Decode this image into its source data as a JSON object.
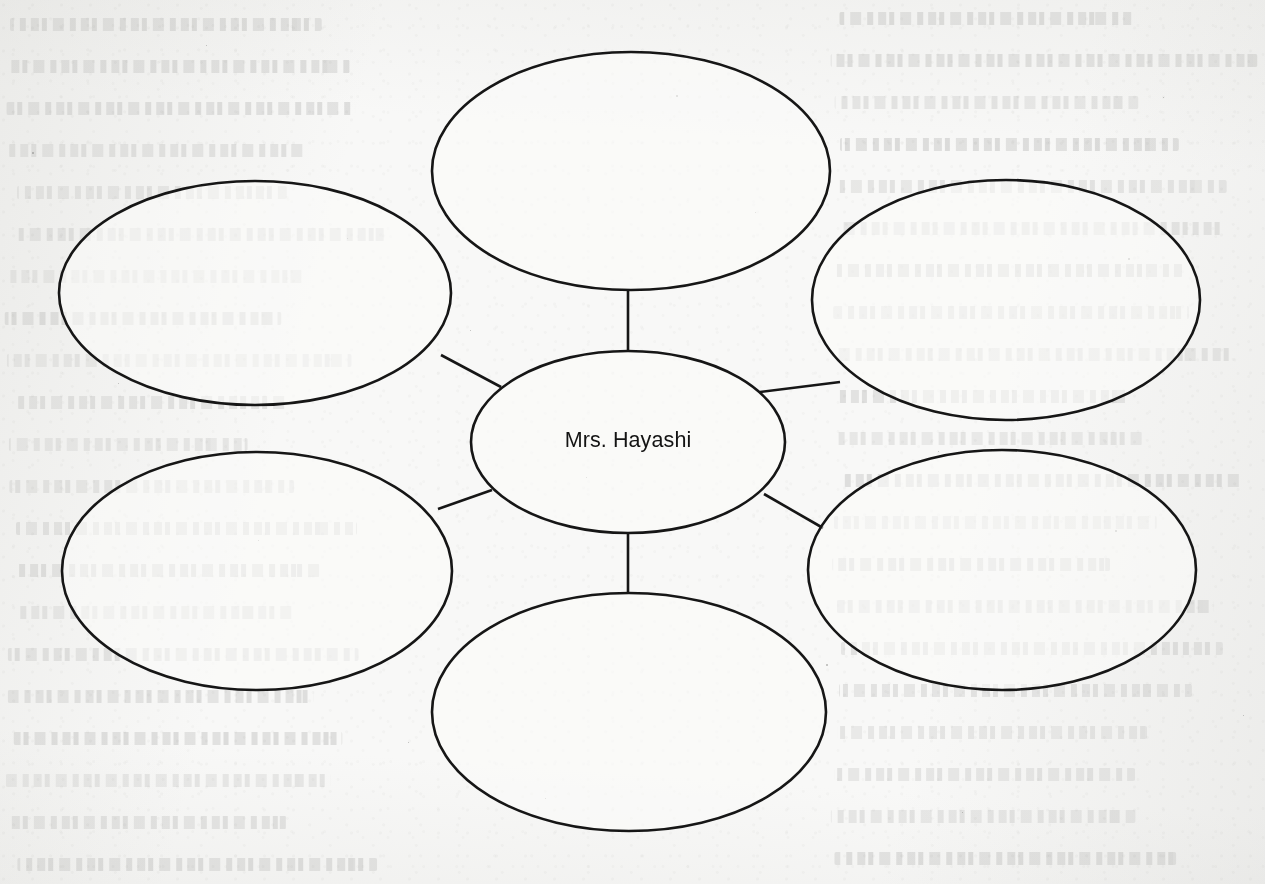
{
  "document": {
    "type": "graphic-organizer-worksheet",
    "description": "Blank character web / bubble map graphic organizer printed on a textured paper page with faint show-through text from the reverse side",
    "page_width": 1265,
    "page_height": 884,
    "paper_color": "#f8f8f7",
    "ink_color": "#161616"
  },
  "organizer": {
    "center": {
      "id": "center-bubble",
      "label": "Mrs. Hayashi",
      "cx": 628,
      "cy": 442,
      "rx": 157,
      "ry": 91,
      "text_x": 628,
      "text_y": 441
    },
    "outer_bubbles": [
      {
        "id": "bubble-top-left",
        "position": "top-left",
        "label": "",
        "cx": 255,
        "cy": 293,
        "rx": 196,
        "ry": 112
      },
      {
        "id": "bubble-top-center",
        "position": "top-center",
        "label": "",
        "cx": 631,
        "cy": 171,
        "rx": 199,
        "ry": 119
      },
      {
        "id": "bubble-top-right",
        "position": "top-right",
        "label": "",
        "cx": 1006,
        "cy": 300,
        "rx": 194,
        "ry": 120
      },
      {
        "id": "bubble-bottom-left",
        "position": "bottom-left",
        "label": "",
        "cx": 257,
        "cy": 571,
        "rx": 195,
        "ry": 119
      },
      {
        "id": "bubble-bottom-center",
        "position": "bottom-center",
        "label": "",
        "cx": 629,
        "cy": 712,
        "rx": 197,
        "ry": 119
      },
      {
        "id": "bubble-bottom-right",
        "position": "bottom-right",
        "label": "",
        "cx": 1002,
        "cy": 570,
        "rx": 194,
        "ry": 120
      }
    ],
    "connectors": [
      {
        "id": "connector-top-center",
        "from": "center-bubble",
        "to": "bubble-top-center",
        "x1": 628,
        "y1": 352,
        "x2": 628,
        "y2": 289
      },
      {
        "id": "connector-bottom-center",
        "from": "center-bubble",
        "to": "bubble-bottom-center",
        "x1": 628,
        "y1": 533,
        "x2": 628,
        "y2": 594
      },
      {
        "id": "connector-top-left",
        "from": "center-bubble",
        "to": "bubble-top-left",
        "x1": 501,
        "y1": 387,
        "x2": 441,
        "y2": 355
      },
      {
        "id": "connector-top-right",
        "from": "center-bubble",
        "to": "bubble-top-right",
        "x1": 760,
        "y1": 392,
        "x2": 840,
        "y2": 382
      },
      {
        "id": "connector-bottom-left",
        "from": "center-bubble",
        "to": "bubble-bottom-left",
        "x1": 492,
        "y1": 490,
        "x2": 438,
        "y2": 509
      },
      {
        "id": "connector-bottom-right",
        "from": "center-bubble",
        "to": "bubble-bottom-right",
        "x1": 764,
        "y1": 494,
        "x2": 823,
        "y2": 528
      }
    ]
  },
  "show_through_text": {
    "note": "Illegible mirrored text bleeding through from the reverse side of the page; rendered as faint blurred line bands",
    "visible_as": "faint gray text lines",
    "line_height": 42,
    "columns": [
      {
        "id": "ghost-column-left",
        "left": 4,
        "width": 372,
        "first_line_top": 18,
        "line_count": 21
      },
      {
        "id": "ghost-column-right",
        "left": 830,
        "width": 430,
        "first_line_top": 12,
        "line_count": 21
      }
    ]
  }
}
